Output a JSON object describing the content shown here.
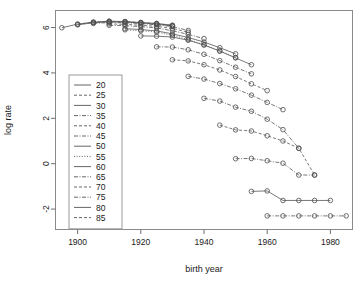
{
  "chart": {
    "type": "line",
    "title": "",
    "xlabel": "birth year",
    "ylabel": "log rate",
    "xlim": [
      1893,
      1987
    ],
    "ylim": [
      -2.9,
      6.75
    ],
    "xticks": [
      1900,
      1920,
      1940,
      1960,
      1980
    ],
    "yticks": [
      6,
      4,
      2,
      0,
      -2
    ],
    "grid": false,
    "legend_position": "left-middle",
    "legend_title": ""
  },
  "chart_data": {
    "type": "line",
    "title": "",
    "xlabel": "birth year",
    "ylabel": "log rate",
    "xlim": [
      1893,
      1987
    ],
    "ylim": [
      -2.9,
      6.75
    ],
    "xticks": [
      1900,
      1920,
      1940,
      1960,
      1980
    ],
    "yticks": [
      6,
      4,
      2,
      0,
      -2
    ],
    "grid": false,
    "legend_position": "left-middle",
    "legend_entries": [
      "20",
      "25",
      "30",
      "35",
      "40",
      "45",
      "50",
      "55",
      "60",
      "65",
      "70",
      "75",
      "80",
      "85"
    ],
    "series": [
      {
        "name": "20",
        "dash": "solid",
        "x": [
          1895,
          1900,
          1905,
          1910,
          1915,
          1920,
          1925,
          1930
        ],
        "values": [
          5.99,
          6.15,
          6.24,
          6.28,
          6.26,
          6.22,
          6.18,
          6.1
        ]
      },
      {
        "name": "25",
        "dash": "dashed",
        "x": [
          1900,
          1905,
          1910,
          1915,
          1920,
          1925,
          1930
        ],
        "values": [
          6.14,
          6.23,
          6.27,
          6.26,
          6.22,
          6.17,
          6.09
        ]
      },
      {
        "name": "30",
        "dash": "solid",
        "x": [
          1900,
          1905,
          1910,
          1915,
          1920,
          1925,
          1930
        ],
        "values": [
          6.12,
          6.21,
          6.25,
          6.24,
          6.2,
          6.15,
          6.07
        ]
      },
      {
        "name": "35",
        "dash": "dashdot",
        "x": [
          1905,
          1910,
          1915,
          1920,
          1925,
          1930,
          1935
        ],
        "values": [
          6.18,
          6.22,
          6.21,
          6.17,
          6.12,
          6.04,
          5.87
        ]
      },
      {
        "name": "40",
        "dash": "dashed",
        "x": [
          1910,
          1915,
          1920,
          1925,
          1930,
          1935
        ],
        "values": [
          6.16,
          6.14,
          6.1,
          6.05,
          5.96,
          5.79
        ]
      },
      {
        "name": "45",
        "dash": "dashdot",
        "x": [
          1910,
          1915,
          1920,
          1925,
          1930,
          1935,
          1940
        ],
        "values": [
          6.1,
          6.08,
          6.04,
          5.98,
          5.86,
          5.7,
          5.51
        ]
      },
      {
        "name": "50",
        "dash": "solid",
        "x": [
          1915,
          1920,
          1925,
          1930,
          1935,
          1940,
          1945,
          1950
        ],
        "values": [
          5.95,
          5.91,
          5.85,
          5.72,
          5.56,
          5.36,
          5.11,
          4.84
        ]
      },
      {
        "name": "55",
        "dash": "dotted",
        "x": [
          1915,
          1920,
          1925,
          1930,
          1935,
          1940,
          1945,
          1950
        ],
        "values": [
          5.9,
          5.86,
          5.8,
          5.66,
          5.47,
          5.24,
          4.97,
          4.68
        ]
      },
      {
        "name": "60",
        "dash": "solid",
        "x": [
          1920,
          1925,
          1930,
          1935,
          1940,
          1945,
          1950,
          1955
        ],
        "values": [
          5.63,
          5.62,
          5.58,
          5.44,
          5.23,
          4.96,
          4.66,
          4.36
        ]
      },
      {
        "name": "65",
        "dash": "dashdot",
        "x": [
          1925,
          1930,
          1935,
          1940,
          1945,
          1950,
          1955
        ],
        "values": [
          5.15,
          5.14,
          5.02,
          4.82,
          4.54,
          4.25,
          3.96
        ]
      },
      {
        "name": "70",
        "dash": "dashed",
        "x": [
          1930,
          1935,
          1940,
          1945,
          1950,
          1955,
          1960
        ],
        "values": [
          4.58,
          4.53,
          4.36,
          4.13,
          3.84,
          3.52,
          3.22
        ]
      },
      {
        "name": "75",
        "dash": "dashdot",
        "x": [
          1935,
          1940,
          1945,
          1950,
          1955,
          1960,
          1965
        ],
        "values": [
          3.85,
          3.73,
          3.53,
          3.3,
          3.02,
          2.7,
          2.38
        ]
      },
      {
        "name": "80",
        "dash": "dashdot",
        "x": [
          1940,
          1945,
          1950,
          1955,
          1960,
          1965,
          1970
        ],
        "values": [
          2.88,
          2.76,
          2.49,
          2.31,
          1.96,
          1.5,
          0.68
        ]
      },
      {
        "name": "85",
        "dash": "dashed",
        "x": [
          1945,
          1950,
          1955,
          1960,
          1965,
          1970,
          1975
        ],
        "values": [
          1.7,
          1.49,
          1.44,
          1.23,
          1.0,
          0.68,
          -0.5
        ]
      },
      {
        "name": "90",
        "dash": "dashdot",
        "x": [
          1950,
          1955,
          1960,
          1965,
          1970,
          1975
        ],
        "values": [
          0.22,
          0.23,
          0.13,
          0.02,
          -0.5,
          -0.5
        ]
      },
      {
        "name": "95",
        "dash": "solid",
        "x": [
          1955,
          1960,
          1965,
          1970,
          1975,
          1980
        ],
        "values": [
          -1.22,
          -1.2,
          -1.62,
          -1.62,
          -1.62,
          -1.62
        ]
      },
      {
        "name": "100",
        "dash": "dashdot",
        "x": [
          1960,
          1965,
          1970,
          1975,
          1980,
          1985
        ],
        "values": [
          -2.3,
          -2.3,
          -2.3,
          -2.3,
          -2.3,
          -2.3
        ]
      }
    ]
  },
  "legend": {
    "items": [
      {
        "label": "20",
        "dash": "solid"
      },
      {
        "label": "25",
        "dash": "dashed"
      },
      {
        "label": "30",
        "dash": "solid"
      },
      {
        "label": "35",
        "dash": "dashdot"
      },
      {
        "label": "40",
        "dash": "dashed"
      },
      {
        "label": "45",
        "dash": "dashdot"
      },
      {
        "label": "50",
        "dash": "solid"
      },
      {
        "label": "55",
        "dash": "dotted"
      },
      {
        "label": "60",
        "dash": "solid"
      },
      {
        "label": "65",
        "dash": "dashdot"
      },
      {
        "label": "70",
        "dash": "dashed"
      },
      {
        "label": "75",
        "dash": "dashdot"
      },
      {
        "label": "80",
        "dash": "solid"
      },
      {
        "label": "85",
        "dash": "dashed"
      }
    ]
  },
  "colors": {
    "ink": "#1a1a1a",
    "frame": "#8a8a8a",
    "line": "#555555",
    "point": "#4d4d4d",
    "background": "#ffffff"
  }
}
